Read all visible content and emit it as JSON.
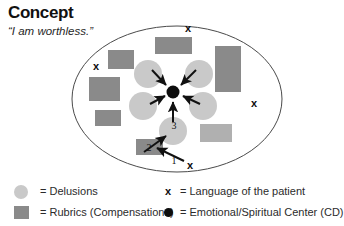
{
  "header": {
    "title": "Concept",
    "subtitle": "“I am worthless.”"
  },
  "colors": {
    "delusion_circle": "#c9c9c9",
    "rubric_rect": "#8a8a8a",
    "rubric_rect_light": "#b0b0b0",
    "center_dot": "#0d0d0d",
    "ellipse_stroke": "#4a4a4a",
    "arrow": "#111111",
    "text": "#1a1a1a"
  },
  "diagram": {
    "ellipse": {
      "cx": 177,
      "cy": 99,
      "rx": 105,
      "ry": 73
    },
    "center_dot": {
      "cx": 173,
      "cy": 92,
      "r": 6.5,
      "label": "Emotional/Spiritual Center (CD)"
    },
    "delusions": [
      {
        "cx": 148,
        "cy": 74,
        "r": 14
      },
      {
        "cx": 199,
        "cy": 74,
        "r": 14
      },
      {
        "cx": 143,
        "cy": 106,
        "r": 14
      },
      {
        "cx": 203,
        "cy": 106,
        "r": 14
      },
      {
        "cx": 173,
        "cy": 131,
        "r": 14
      }
    ],
    "rubrics": [
      {
        "x": 155,
        "y": 37,
        "w": 37,
        "h": 17,
        "shade": "dark"
      },
      {
        "x": 108,
        "y": 50,
        "w": 26,
        "h": 19,
        "shade": "dark"
      },
      {
        "x": 89,
        "y": 77,
        "w": 31,
        "h": 24,
        "shade": "dark"
      },
      {
        "x": 95,
        "y": 110,
        "w": 26,
        "h": 16,
        "shade": "dark"
      },
      {
        "x": 215,
        "y": 46,
        "w": 26,
        "h": 46,
        "shade": "dark"
      },
      {
        "x": 200,
        "y": 124,
        "w": 32,
        "h": 18,
        "shade": "light"
      },
      {
        "x": 136,
        "y": 139,
        "w": 27,
        "h": 16,
        "shade": "dark"
      }
    ],
    "patient_language_marks": [
      {
        "x": 188,
        "y": 29,
        "label": "x"
      },
      {
        "x": 96,
        "y": 67,
        "label": "x"
      },
      {
        "x": 254,
        "y": 104,
        "label": "x"
      },
      {
        "x": 190,
        "y": 166,
        "label": "x"
      }
    ],
    "arrows": [
      {
        "from": [
          152,
          71
        ],
        "to": [
          167,
          86
        ],
        "name": "delusion-to-center-upper-left"
      },
      {
        "from": [
          196,
          71
        ],
        "to": [
          180,
          86
        ],
        "name": "delusion-to-center-upper-right"
      },
      {
        "from": [
          151,
          104
        ],
        "to": [
          166,
          95
        ],
        "name": "delusion-to-center-lower-left"
      },
      {
        "from": [
          199,
          104
        ],
        "to": [
          182,
          95
        ],
        "name": "delusion-to-center-lower-right"
      },
      {
        "from": [
          173,
          122
        ],
        "to": [
          173,
          101
        ],
        "name": "delusion-to-center-bottom"
      },
      {
        "from": [
          146,
          152
        ],
        "to": [
          167,
          136
        ],
        "name": "rubric-to-delusion"
      },
      {
        "from": [
          182,
          160
        ],
        "to": [
          157,
          148
        ],
        "name": "patient-language-to-rubric"
      }
    ],
    "number_labels": [
      {
        "text": "3",
        "x": 173,
        "y": 126
      },
      {
        "text": "2",
        "x": 148,
        "y": 148
      },
      {
        "text": "1",
        "x": 175,
        "y": 160
      }
    ]
  },
  "legend": {
    "left": [
      {
        "marker": "delusion-circle-icon",
        "text": "= Delusions"
      },
      {
        "marker": "rubric-square-icon",
        "text": "= Rubrics (Compensations)"
      }
    ],
    "right": [
      {
        "marker": "patient-language-x-icon",
        "marker_text": "x",
        "text": "= Language of the patient"
      },
      {
        "marker": "center-dot-icon",
        "text": "= Emotional/Spiritual Center (CD)"
      }
    ]
  }
}
